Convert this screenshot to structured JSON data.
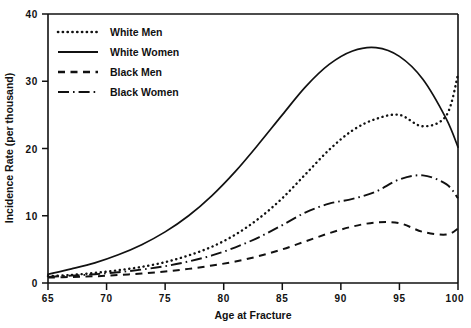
{
  "chart_data": {
    "type": "line",
    "title": "",
    "xlabel": "Age at Fracture",
    "ylabel": "Incidence Rate (per thousand)",
    "xlim": [
      65,
      100
    ],
    "ylim": [
      0,
      40
    ],
    "xticks": [
      65,
      70,
      75,
      80,
      85,
      90,
      95,
      100
    ],
    "yticks": [
      0,
      10,
      20,
      30,
      40
    ],
    "grid": false,
    "legend_position": "top-left",
    "x": [
      65,
      67,
      69,
      71,
      73,
      75,
      77,
      79,
      81,
      83,
      85,
      87,
      89,
      91,
      93,
      95,
      97,
      99,
      100
    ],
    "series": [
      {
        "name": "White Men",
        "style": "dotted",
        "color": "#111111",
        "values": [
          1.0,
          1.2,
          1.5,
          1.9,
          2.4,
          3.1,
          4.1,
          5.4,
          7.2,
          9.6,
          12.6,
          16.2,
          19.8,
          22.7,
          24.4,
          25.0,
          23.3,
          24.9,
          31.0
        ]
      },
      {
        "name": "White Women",
        "style": "solid",
        "color": "#111111",
        "values": [
          1.3,
          2.1,
          3.0,
          4.2,
          5.7,
          7.6,
          10.0,
          13.0,
          16.6,
          20.7,
          25.0,
          29.2,
          32.5,
          34.5,
          35.0,
          33.7,
          30.3,
          24.4,
          20.2
        ]
      },
      {
        "name": "Black Men",
        "style": "dashed",
        "color": "#111111",
        "values": [
          0.8,
          0.9,
          1.0,
          1.2,
          1.4,
          1.7,
          2.1,
          2.6,
          3.2,
          4.0,
          5.0,
          6.2,
          7.4,
          8.4,
          9.0,
          8.9,
          7.6,
          7.2,
          8.1
        ]
      },
      {
        "name": "Black Women",
        "style": "dashdot",
        "color": "#111111",
        "values": [
          0.9,
          1.1,
          1.3,
          1.6,
          2.0,
          2.5,
          3.2,
          4.1,
          5.3,
          6.8,
          8.6,
          10.5,
          11.8,
          12.5,
          13.6,
          15.4,
          16.0,
          14.7,
          12.6
        ]
      }
    ]
  },
  "axes": {
    "x_tick_labels": [
      "65",
      "70",
      "75",
      "80",
      "85",
      "90",
      "95",
      "100"
    ],
    "y_tick_labels": [
      "0",
      "10",
      "20",
      "30",
      "40"
    ],
    "x_axis_title": "Age at Fracture",
    "y_axis_title": "Incidence Rate (per thousand)"
  },
  "legend": {
    "items": [
      {
        "label": "White Men",
        "style": "dotted"
      },
      {
        "label": "White Women",
        "style": "solid"
      },
      {
        "label": "Black Men",
        "style": "dashed"
      },
      {
        "label": "Black Women",
        "style": "dashdot"
      }
    ]
  }
}
